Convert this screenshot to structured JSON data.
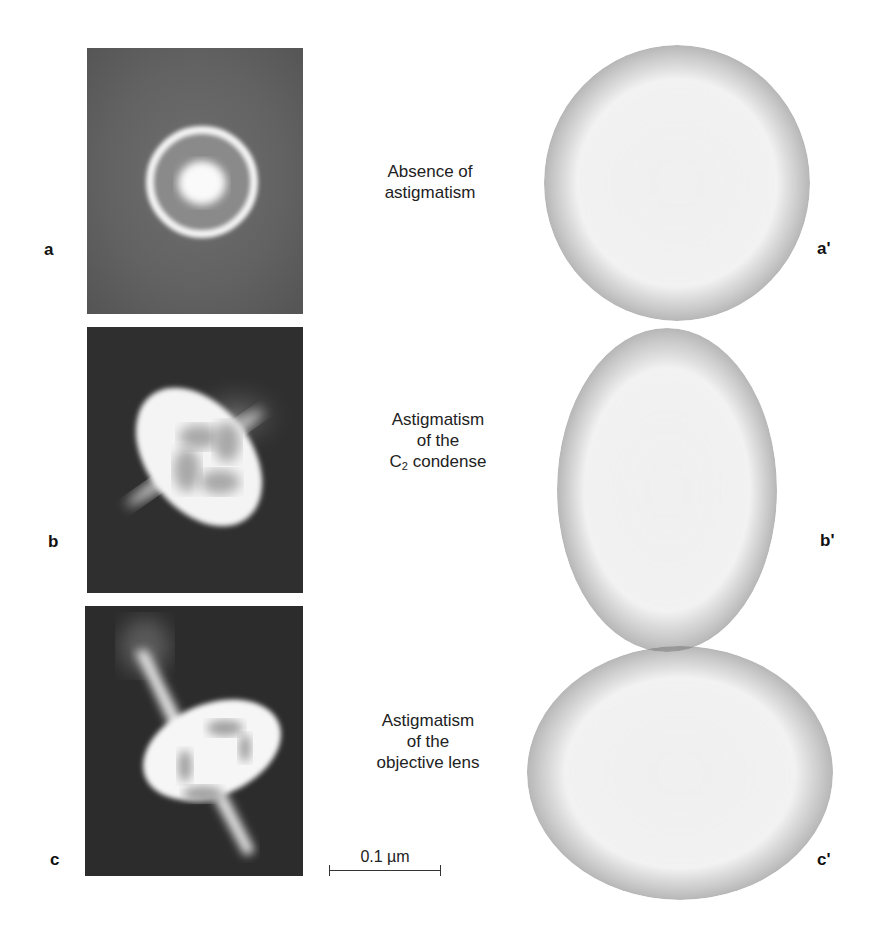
{
  "figure": {
    "left_panels": [
      {
        "id": "a",
        "label": "a",
        "description": "CBED disk, no astigmatism: round bright ring with bright centre on grey background"
      },
      {
        "id": "b",
        "label": "b",
        "description": "Elliptical bright disk tilted, with four darker lobes and two streaks; condenser astigmatism"
      },
      {
        "id": "c",
        "label": "c",
        "description": "Distorted bright disk with long diagonal streaks; objective lens astigmatism"
      }
    ],
    "captions": [
      {
        "id": "a",
        "lines": [
          "Absence of",
          "astigmatism"
        ]
      },
      {
        "id": "b",
        "line1": "Astigmatism",
        "line2": "of  the",
        "line3_pre": "C",
        "line3_sub": "2",
        "line3_post": " condense"
      },
      {
        "id": "c",
        "lines": [
          "Astigmatism",
          "of  the",
          "objective lens"
        ]
      }
    ],
    "right_panels": [
      {
        "id": "a_prime",
        "label": "a'",
        "shape": "circle"
      },
      {
        "id": "b_prime",
        "label": "b'",
        "shape": "vertical ellipse"
      },
      {
        "id": "c_prime",
        "label": "c'",
        "shape": "horizontal ellipse"
      }
    ],
    "scale_bar": {
      "text": "0.1 µm"
    }
  }
}
